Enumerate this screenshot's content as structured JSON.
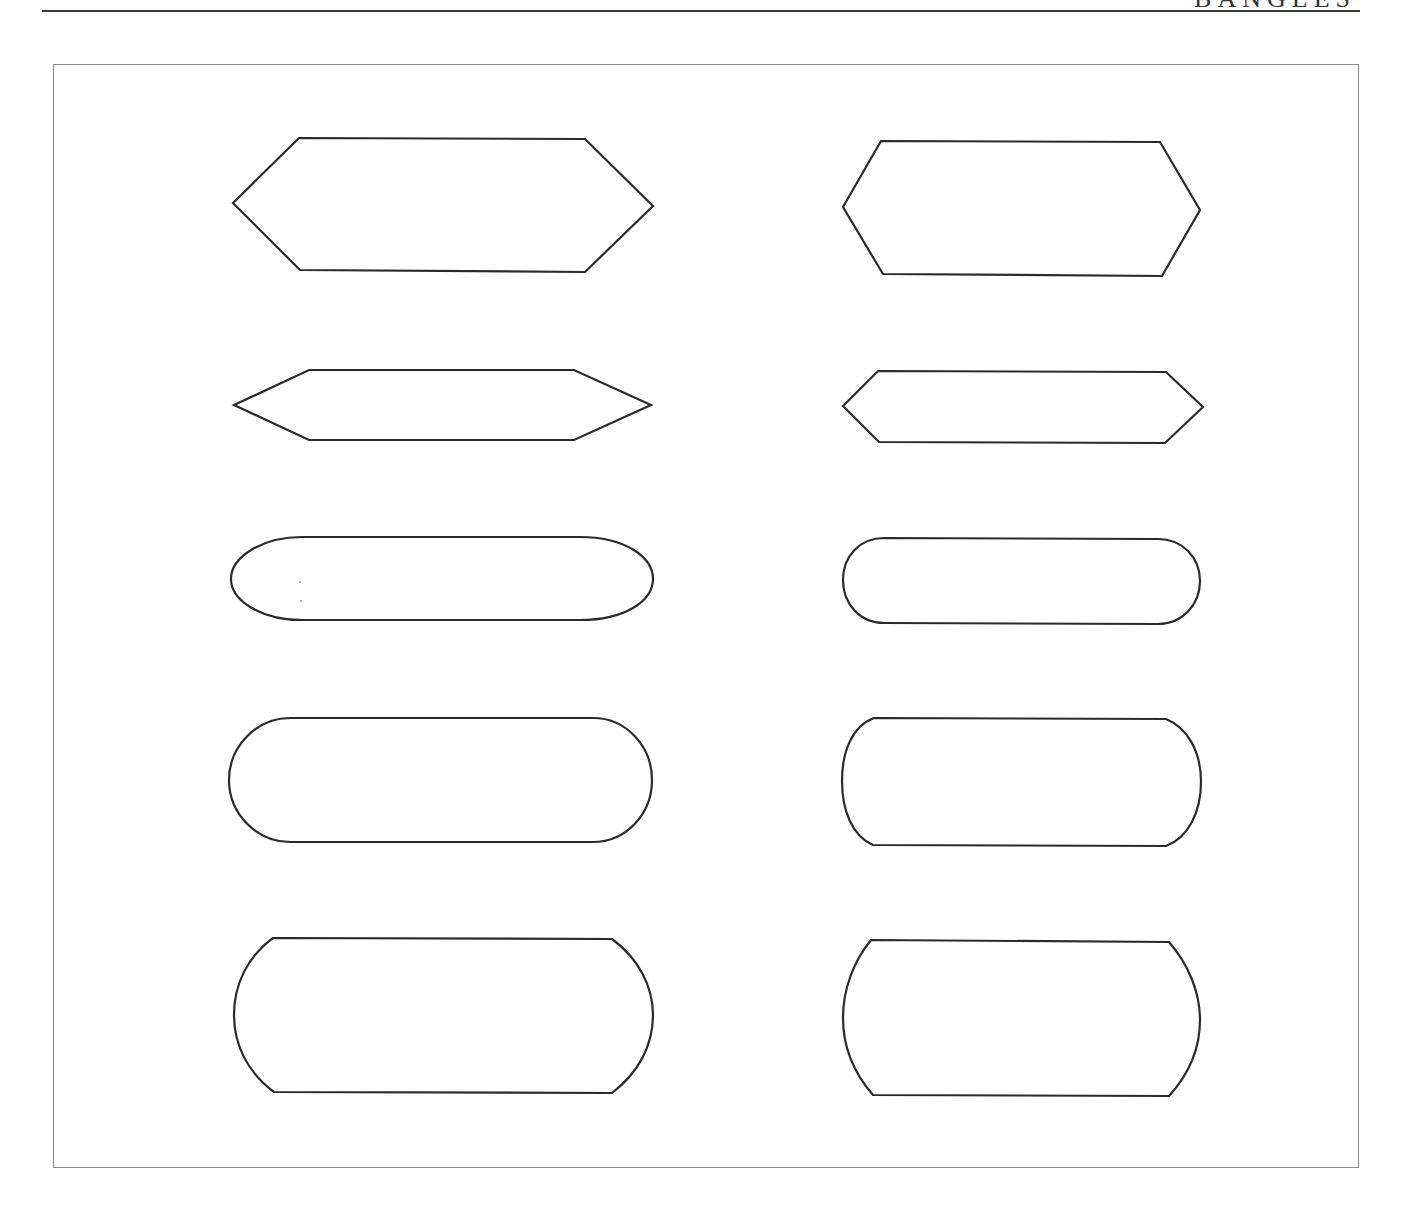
{
  "page": {
    "running_head": "BANGLES"
  },
  "plate": {
    "description": "Ten outline bangle/label shape templates arranged in two columns of five rows",
    "shapes": [
      {
        "row": 1,
        "column": "left",
        "kind": "elongated-hexagon"
      },
      {
        "row": 1,
        "column": "right",
        "kind": "hexagon"
      },
      {
        "row": 2,
        "column": "left",
        "kind": "pointed-lozenge"
      },
      {
        "row": 2,
        "column": "right",
        "kind": "chamfered-bar"
      },
      {
        "row": 3,
        "column": "left",
        "kind": "ellipse-capsule"
      },
      {
        "row": 3,
        "column": "right",
        "kind": "rounded-capsule"
      },
      {
        "row": 4,
        "column": "left",
        "kind": "stadium"
      },
      {
        "row": 4,
        "column": "right",
        "kind": "convex-ended-rectangle"
      },
      {
        "row": 5,
        "column": "left",
        "kind": "arc-ended-rectangle"
      },
      {
        "row": 5,
        "column": "right",
        "kind": "arc-ended-rectangle-wide"
      }
    ]
  }
}
